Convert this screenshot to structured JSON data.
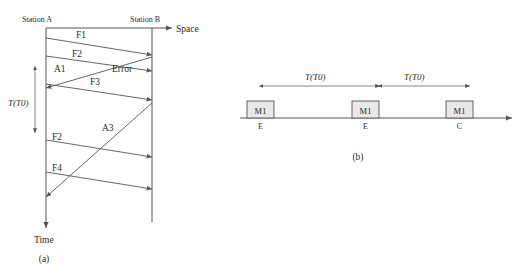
{
  "figure": {
    "panel_a": {
      "caption": "(a)",
      "station_a_label": "Station A",
      "station_b_label": "Station B",
      "space_axis_label": "Space",
      "time_axis_label": "Time",
      "interval_label": "T(T0)",
      "frames": [
        {
          "name": "F1",
          "direction": "a-to-b"
        },
        {
          "name": "F2",
          "direction": "a-to-b"
        },
        {
          "name": "A1",
          "direction": "b-to-a"
        },
        {
          "name": "Error",
          "direction": "a-to-b"
        },
        {
          "name": "F3",
          "direction": "a-to-b"
        },
        {
          "name": "A3",
          "direction": "b-to-a"
        },
        {
          "name": "F2",
          "direction": "a-to-b"
        },
        {
          "name": "F4",
          "direction": "a-to-b"
        }
      ]
    },
    "panel_b": {
      "caption": "(b)",
      "interval_labels": [
        "T(T0)",
        "T(T0)"
      ],
      "events": [
        {
          "box": "M1",
          "state": "E"
        },
        {
          "box": "M1",
          "state": "E"
        },
        {
          "box": "M1",
          "state": "C"
        }
      ]
    }
  }
}
